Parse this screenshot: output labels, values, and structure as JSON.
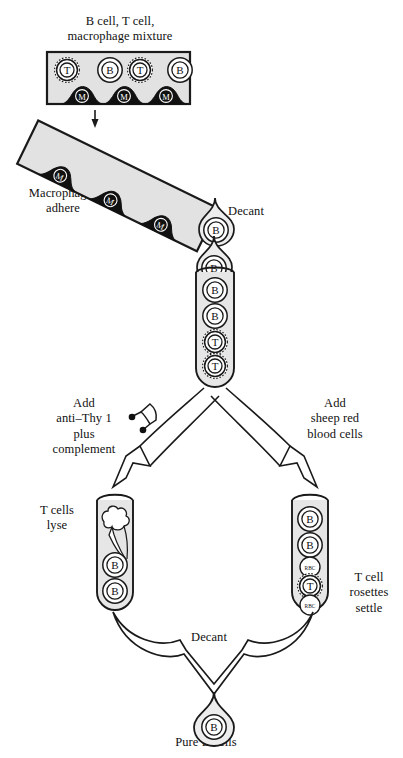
{
  "figure": {
    "title_top": "B cell, T cell,\nmacrophage mixture",
    "type": "biology-process-diagram",
    "colors": {
      "outline": "#1a1a1a",
      "dish_fill": "#e2e2e2",
      "tube_fill": "#e6e6e6",
      "macrophage_fill": "#111111",
      "macrophage_text": "#ffffff",
      "cell_fill": "#ffffff",
      "droplet_fill": "#ededed",
      "page_bg": "#ffffff"
    }
  },
  "labels": {
    "top_mixture": "B cell, T cell,\nmacrophage mixture",
    "macrophages_adhere": "Macrophages\nadhere",
    "decant_top": "Decant",
    "add_anti_thy": "Add\nanti–Thy 1\nplus\ncomplement",
    "add_srbc": "Add\nsheep red\nblood cells",
    "t_cells_lyse": "T cells\nlyse",
    "t_cell_rosettes": "T cell\nrosettes\nsettle",
    "decant_bottom": "Decant",
    "pure_b_cells": "Pure B cells"
  },
  "cell_glyphs": {
    "b": "B",
    "t": "T",
    "macrophage": "M",
    "rbc": "RBC"
  },
  "steps": [
    {
      "id": "step-1-mixture",
      "name": "culture-dish-mixture",
      "caption": "B cell, T cell,\nmacrophage mixture",
      "contents": [
        "T",
        "B",
        "T",
        "B",
        "M",
        "M",
        "M"
      ]
    },
    {
      "id": "step-2-adhere",
      "name": "tilted-dish-macrophages-adhere",
      "caption": "Macrophages\nadhere",
      "contents": [
        "M",
        "M",
        "M"
      ]
    },
    {
      "id": "step-3-decant",
      "name": "decant-droplets",
      "caption": "Decant",
      "contents": [
        "B",
        "B"
      ]
    },
    {
      "id": "step-4-tube",
      "name": "center-test-tube",
      "caption": "",
      "contents": [
        "B",
        "B",
        "B",
        "T",
        "T"
      ]
    },
    {
      "id": "step-5-left",
      "name": "left-test-tube-lysed",
      "caption": "T cells\nlyse",
      "treatment": "Add\nanti–Thy 1\nplus\ncomplement",
      "contents": [
        "lysed-debris",
        "B",
        "B"
      ]
    },
    {
      "id": "step-6-right",
      "name": "right-test-tube-rosettes",
      "caption": "T cell\nrosettes\nsettle",
      "treatment": "Add\nsheep red\nblood cells",
      "contents": [
        "B",
        "B",
        "RBC",
        "T",
        "RBC"
      ]
    },
    {
      "id": "step-7-final",
      "name": "final-droplet",
      "caption": "Pure B cells",
      "contents": [
        "B"
      ]
    }
  ]
}
